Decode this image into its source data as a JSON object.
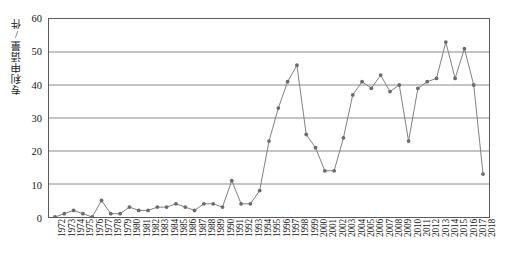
{
  "chart_data": {
    "type": "line",
    "title": "",
    "subtitle": "",
    "xlabel": "",
    "ylabel": "专利申请量/件",
    "xlim": [
      1972,
      2018
    ],
    "ylim": [
      0,
      60
    ],
    "yticks": [
      0,
      10,
      20,
      30,
      40,
      50,
      60
    ],
    "ytick_labels": [
      "0",
      "10",
      "20",
      "30",
      "40",
      "50",
      "60"
    ],
    "grid": true,
    "grid_axis": "y",
    "legend": false,
    "legend_position": "none",
    "marker": "circle",
    "line_color": "#808080",
    "marker_color": "#6b6b6b",
    "categories": [
      "1972",
      "1973",
      "1974",
      "1975",
      "1976",
      "1977",
      "1978",
      "1979",
      "1980",
      "1981",
      "1982",
      "1983",
      "1984",
      "1985",
      "1986",
      "1987",
      "1988",
      "1989",
      "1990",
      "1991",
      "1992",
      "1993",
      "1994",
      "1995",
      "1996",
      "1997",
      "1998",
      "1999",
      "2000",
      "2001",
      "2002",
      "2003",
      "2004",
      "2005",
      "2006",
      "2007",
      "2008",
      "2009",
      "2010",
      "2011",
      "2012",
      "2013",
      "2014",
      "2015",
      "2016",
      "2017",
      "2018"
    ],
    "x": [
      1972,
      1973,
      1974,
      1975,
      1976,
      1977,
      1978,
      1979,
      1980,
      1981,
      1982,
      1983,
      1984,
      1985,
      1986,
      1987,
      1988,
      1989,
      1990,
      1991,
      1992,
      1993,
      1994,
      1995,
      1996,
      1997,
      1998,
      1999,
      2000,
      2001,
      2002,
      2003,
      2004,
      2005,
      2006,
      2007,
      2008,
      2009,
      2010,
      2011,
      2012,
      2013,
      2014,
      2015,
      2016,
      2017,
      2018
    ],
    "values": [
      0,
      1,
      2,
      1,
      0,
      5,
      1,
      1,
      3,
      2,
      2,
      3,
      3,
      4,
      3,
      2,
      4,
      4,
      3,
      11,
      4,
      4,
      8,
      23,
      33,
      41,
      46,
      25,
      21,
      14,
      14,
      24,
      37,
      41,
      39,
      43,
      38,
      40,
      23,
      39,
      41,
      42,
      53,
      42,
      51,
      40,
      13
    ],
    "series": [
      {
        "name": "专利申请量",
        "values": [
          0,
          1,
          2,
          1,
          0,
          5,
          1,
          1,
          3,
          2,
          2,
          3,
          3,
          4,
          3,
          2,
          4,
          4,
          3,
          11,
          4,
          4,
          8,
          23,
          33,
          41,
          46,
          25,
          21,
          14,
          14,
          24,
          37,
          41,
          39,
          43,
          38,
          40,
          23,
          39,
          41,
          42,
          53,
          42,
          51,
          40,
          13
        ]
      }
    ]
  }
}
